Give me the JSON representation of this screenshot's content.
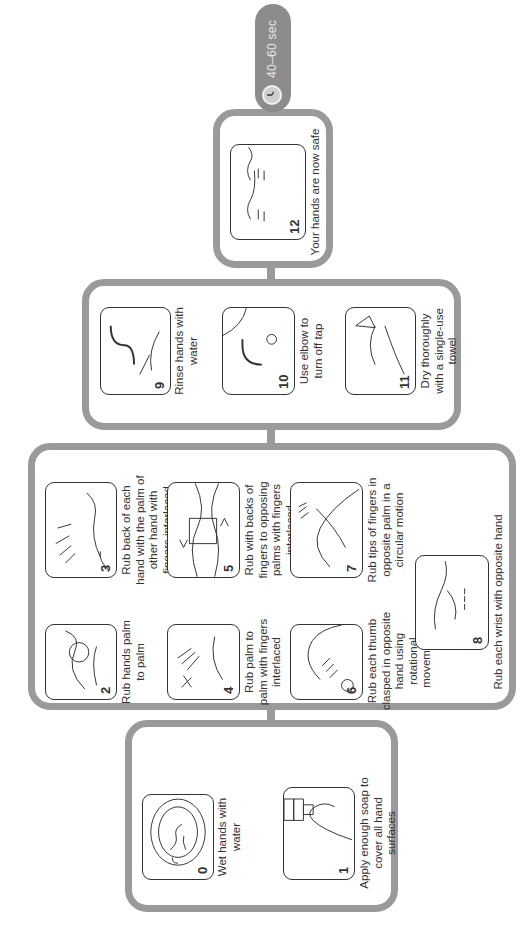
{
  "duration_badge": {
    "label": "40–60 sec",
    "icon": "clock-icon"
  },
  "colors": {
    "frame": "#9a9a9a",
    "badge": "#8c8c8c",
    "outline": "#333333"
  },
  "groups": [
    {
      "name": "prepare",
      "steps": [
        {
          "number": "0",
          "caption": "Wet hands with water",
          "illustration": "hands-under-tap-icon"
        },
        {
          "number": "1",
          "caption": "Apply enough soap to cover all hand surfaces",
          "illustration": "soap-dispenser-icon"
        }
      ]
    },
    {
      "name": "rub",
      "steps": [
        {
          "number": "2",
          "caption": "Rub hands palm to palm",
          "illustration": "palm-to-palm-icon"
        },
        {
          "number": "3",
          "caption": "Rub back of each hand with the palm of other hand with fingers interlaced",
          "illustration": "back-of-hand-icon"
        },
        {
          "number": "4",
          "caption": "Rub palm to palm with fingers interlaced",
          "illustration": "interlaced-fingers-icon"
        },
        {
          "number": "5",
          "caption": "Rub with backs of fingers to opposing palms with fingers interlaced",
          "illustration": "backs-of-fingers-icon"
        },
        {
          "number": "6",
          "caption": "Rub each thumb clasped in opposite hand using rotational movement",
          "illustration": "thumb-rotation-icon"
        },
        {
          "number": "7",
          "caption": "Rub tips of fingers in opposite palm in a circular motion",
          "illustration": "fingertips-circular-icon"
        },
        {
          "number": "8",
          "caption": "Rub each  wrist with opposite hand",
          "illustration": "wrist-rub-icon"
        }
      ]
    },
    {
      "name": "rinse-dry",
      "steps": [
        {
          "number": "9",
          "caption": "Rinse hands with water",
          "illustration": "rinse-hands-icon"
        },
        {
          "number": "10",
          "caption": "Use elbow to turn off tap",
          "illustration": "elbow-tap-icon"
        },
        {
          "number": "11",
          "caption": "Dry thoroughly with a single-use towel",
          "illustration": "paper-towel-icon"
        }
      ]
    },
    {
      "name": "done",
      "steps": [
        {
          "number": "12",
          "caption": "Your hands are now safe",
          "illustration": "clean-hands-icon"
        }
      ]
    }
  ]
}
